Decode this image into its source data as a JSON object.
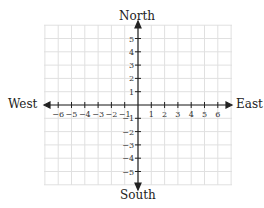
{
  "diagram": {
    "type": "coordinate-plane-compass",
    "labels": {
      "north": "North",
      "south": "South",
      "east": "East",
      "west": "West"
    },
    "x_ticks": [
      "−6",
      "−5",
      "−4",
      "−3",
      "−2",
      "−1",
      "1",
      "2",
      "3",
      "4",
      "5",
      "6"
    ],
    "y_ticks_positive": [
      "5",
      "4",
      "3",
      "2",
      "1"
    ],
    "y_ticks_negative": [
      "−1",
      "−2",
      "−3",
      "−4",
      "−5"
    ],
    "grid_color": "#dddddd",
    "axis_color": "#222222"
  }
}
